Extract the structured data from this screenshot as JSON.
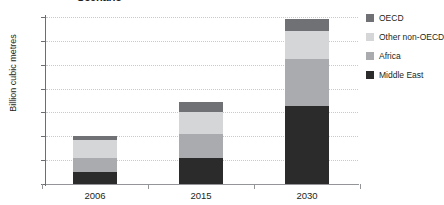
{
  "chart_data": {
    "type": "bar",
    "subtype": "stacked-vertical",
    "title": "Scenario",
    "xlabel": "",
    "ylabel": "Billion cubic metres",
    "categories": [
      "2006",
      "2015",
      "2030"
    ],
    "series": [
      {
        "name": "Middle East",
        "values": [
          50,
          108,
          325
        ],
        "color": "#2b2b2b"
      },
      {
        "name": "Africa",
        "values": [
          58,
          100,
          200
        ],
        "color": "#a9abae"
      },
      {
        "name": "Other non-OECD",
        "values": [
          75,
          92,
          115
        ],
        "color": "#d5d6d7"
      },
      {
        "name": "OECD",
        "values": [
          17,
          42,
          50
        ],
        "color": "#6f7174"
      }
    ],
    "stack_order_bottom_to_top": [
      "Middle East",
      "Africa",
      "Other non-OECD",
      "OECD"
    ],
    "totals": [
      208,
      342,
      690
    ],
    "ylim": [
      0,
      700
    ],
    "ytick_step": 100,
    "yticks": [
      "700",
      "600",
      "500",
      "400",
      "300",
      "200",
      "100",
      "0"
    ],
    "grid": "horizontal-dotted",
    "legend_position": "right",
    "legend_order": [
      "OECD",
      "Other non-OECD",
      "Africa",
      "Middle East"
    ]
  },
  "legend": {
    "items": [
      {
        "label": "OECD",
        "color": "#6f7174"
      },
      {
        "label": "Other non-OECD",
        "color": "#d5d6d7"
      },
      {
        "label": "Africa",
        "color": "#a9abae"
      },
      {
        "label": "Middle East",
        "color": "#2b2b2b"
      }
    ]
  },
  "axes": {
    "y_title": "Billion cubic metres",
    "y_ticks": [
      "700",
      "600",
      "500",
      "400",
      "300",
      "200",
      "100",
      "0"
    ],
    "x_ticks": [
      "2006",
      "2015",
      "2030"
    ]
  },
  "colors": {
    "oecd": "#6f7174",
    "other_non_oecd": "#d5d6d7",
    "africa": "#a9abae",
    "middle_east": "#2b2b2b",
    "axis": "#6d6e71",
    "grid": "#c9cacc",
    "text": "#231f20"
  }
}
